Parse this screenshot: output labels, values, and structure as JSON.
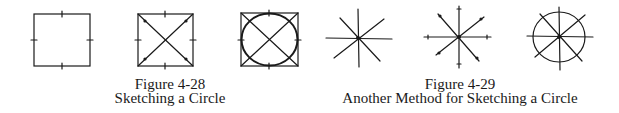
{
  "figures": [
    {
      "id": "figure-4-28",
      "number": "Figure 4-28",
      "title": "Sketching a Circle",
      "steps": [
        "square-with-midpoint-ticks",
        "square-with-diagonals",
        "circle-inscribed-in-square"
      ]
    },
    {
      "id": "figure-4-29",
      "number": "Figure 4-29",
      "title": "Another Method for Sketching a Circle",
      "steps": [
        "eight-radial-lines",
        "radial-lines-with-radius-marks",
        "circle-through-radius-marks"
      ]
    }
  ],
  "colors": {
    "ink": "#1a1a1a",
    "background": "#ffffff"
  }
}
